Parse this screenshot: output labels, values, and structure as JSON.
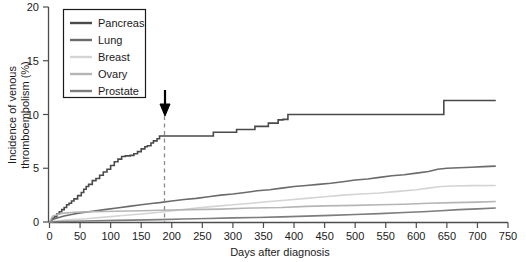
{
  "chart_data": {
    "type": "line",
    "title": "",
    "xlabel": "Days after diagnosis",
    "ylabel": "Incidence of venous thromboembolism (%)",
    "xlim": [
      0,
      750
    ],
    "ylim": [
      0,
      20
    ],
    "xticks": [
      0,
      50,
      100,
      150,
      200,
      250,
      300,
      350,
      400,
      450,
      500,
      550,
      600,
      650,
      700,
      750
    ],
    "yticks": [
      0,
      5,
      10,
      15,
      20
    ],
    "grid": false,
    "legend_position": "top-left",
    "annotations": [
      {
        "name": "six-month-marker",
        "type": "vertical-dashed-line-with-arrow",
        "x": 180,
        "label": ""
      }
    ],
    "series": [
      {
        "name": "Pancreas",
        "color": "#4a4a4a",
        "points": [
          [
            0,
            0.0
          ],
          [
            4,
            0.35
          ],
          [
            8,
            0.5
          ],
          [
            12,
            0.75
          ],
          [
            16,
            0.95
          ],
          [
            20,
            1.15
          ],
          [
            24,
            1.35
          ],
          [
            28,
            1.6
          ],
          [
            32,
            1.75
          ],
          [
            36,
            1.95
          ],
          [
            40,
            2.15
          ],
          [
            46,
            2.45
          ],
          [
            52,
            2.75
          ],
          [
            56,
            3.05
          ],
          [
            60,
            3.3
          ],
          [
            64,
            3.5
          ],
          [
            70,
            3.85
          ],
          [
            76,
            4.05
          ],
          [
            82,
            4.35
          ],
          [
            88,
            4.65
          ],
          [
            94,
            4.9
          ],
          [
            100,
            5.25
          ],
          [
            106,
            5.6
          ],
          [
            112,
            5.85
          ],
          [
            118,
            6.1
          ],
          [
            124,
            6.15
          ],
          [
            132,
            6.2
          ],
          [
            138,
            6.35
          ],
          [
            144,
            6.55
          ],
          [
            150,
            6.8
          ],
          [
            156,
            7.0
          ],
          [
            160,
            7.1
          ],
          [
            166,
            7.35
          ],
          [
            170,
            7.55
          ],
          [
            176,
            7.75
          ],
          [
            180,
            8.0
          ],
          [
            196,
            8.0
          ],
          [
            230,
            8.0
          ],
          [
            262,
            8.0
          ],
          [
            268,
            8.35
          ],
          [
            300,
            8.35
          ],
          [
            306,
            8.6
          ],
          [
            330,
            8.6
          ],
          [
            336,
            8.9
          ],
          [
            352,
            8.9
          ],
          [
            358,
            9.2
          ],
          [
            368,
            9.2
          ],
          [
            374,
            9.5
          ],
          [
            382,
            9.55
          ],
          [
            390,
            10.0
          ],
          [
            404,
            10.0
          ],
          [
            470,
            10.0
          ],
          [
            540,
            10.0
          ],
          [
            600,
            10.0
          ],
          [
            640,
            10.0
          ],
          [
            645,
            11.3
          ],
          [
            660,
            11.3
          ],
          [
            700,
            11.3
          ],
          [
            730,
            11.3
          ]
        ]
      },
      {
        "name": "Lung",
        "color": "#6b6b6b",
        "points": [
          [
            0,
            0.0
          ],
          [
            6,
            0.25
          ],
          [
            14,
            0.4
          ],
          [
            24,
            0.55
          ],
          [
            36,
            0.7
          ],
          [
            50,
            0.85
          ],
          [
            70,
            1.0
          ],
          [
            90,
            1.15
          ],
          [
            110,
            1.3
          ],
          [
            130,
            1.45
          ],
          [
            150,
            1.6
          ],
          [
            170,
            1.75
          ],
          [
            180,
            1.8
          ],
          [
            200,
            1.95
          ],
          [
            220,
            2.1
          ],
          [
            240,
            2.2
          ],
          [
            260,
            2.35
          ],
          [
            280,
            2.5
          ],
          [
            300,
            2.6
          ],
          [
            320,
            2.75
          ],
          [
            340,
            2.9
          ],
          [
            360,
            3.0
          ],
          [
            380,
            3.15
          ],
          [
            400,
            3.3
          ],
          [
            420,
            3.4
          ],
          [
            440,
            3.5
          ],
          [
            460,
            3.6
          ],
          [
            480,
            3.75
          ],
          [
            500,
            3.9
          ],
          [
            520,
            4.0
          ],
          [
            540,
            4.15
          ],
          [
            560,
            4.3
          ],
          [
            580,
            4.4
          ],
          [
            600,
            4.55
          ],
          [
            620,
            4.7
          ],
          [
            635,
            4.9
          ],
          [
            650,
            5.0
          ],
          [
            670,
            5.05
          ],
          [
            690,
            5.1
          ],
          [
            710,
            5.15
          ],
          [
            730,
            5.2
          ]
        ]
      },
      {
        "name": "Breast",
        "color": "#d4d4d4",
        "points": [
          [
            0,
            0.0
          ],
          [
            10,
            0.1
          ],
          [
            30,
            0.2
          ],
          [
            60,
            0.3
          ],
          [
            90,
            0.45
          ],
          [
            120,
            0.6
          ],
          [
            150,
            0.75
          ],
          [
            180,
            0.9
          ],
          [
            210,
            1.1
          ],
          [
            240,
            1.3
          ],
          [
            270,
            1.45
          ],
          [
            300,
            1.6
          ],
          [
            330,
            1.75
          ],
          [
            360,
            1.9
          ],
          [
            390,
            2.05
          ],
          [
            420,
            2.2
          ],
          [
            450,
            2.35
          ],
          [
            480,
            2.5
          ],
          [
            510,
            2.6
          ],
          [
            540,
            2.7
          ],
          [
            570,
            2.85
          ],
          [
            600,
            3.0
          ],
          [
            620,
            3.15
          ],
          [
            640,
            3.3
          ],
          [
            660,
            3.35
          ],
          [
            690,
            3.38
          ],
          [
            730,
            3.4
          ]
        ]
      },
      {
        "name": "Ovary",
        "color": "#b5b5b5",
        "points": [
          [
            0,
            0.0
          ],
          [
            5,
            0.55
          ],
          [
            20,
            0.8
          ],
          [
            40,
            0.9
          ],
          [
            70,
            0.95
          ],
          [
            110,
            1.0
          ],
          [
            150,
            1.05
          ],
          [
            180,
            1.1
          ],
          [
            230,
            1.15
          ],
          [
            280,
            1.2
          ],
          [
            330,
            1.3
          ],
          [
            380,
            1.35
          ],
          [
            420,
            1.45
          ],
          [
            450,
            1.5
          ],
          [
            500,
            1.55
          ],
          [
            540,
            1.6
          ],
          [
            580,
            1.65
          ],
          [
            620,
            1.75
          ],
          [
            660,
            1.8
          ],
          [
            700,
            1.85
          ],
          [
            730,
            1.9
          ]
        ]
      },
      {
        "name": "Prostate",
        "color": "#7d7d7d",
        "points": [
          [
            0,
            0.0
          ],
          [
            20,
            0.05
          ],
          [
            60,
            0.1
          ],
          [
            110,
            0.15
          ],
          [
            160,
            0.2
          ],
          [
            180,
            0.22
          ],
          [
            220,
            0.28
          ],
          [
            260,
            0.32
          ],
          [
            300,
            0.38
          ],
          [
            340,
            0.42
          ],
          [
            380,
            0.48
          ],
          [
            420,
            0.55
          ],
          [
            460,
            0.62
          ],
          [
            500,
            0.7
          ],
          [
            540,
            0.78
          ],
          [
            580,
            0.88
          ],
          [
            610,
            0.95
          ],
          [
            640,
            1.05
          ],
          [
            670,
            1.15
          ],
          [
            700,
            1.22
          ],
          [
            730,
            1.3
          ]
        ]
      }
    ]
  },
  "legend": {
    "entries": [
      {
        "label": "Pancreas",
        "color": "#4a4a4a"
      },
      {
        "label": "Lung",
        "color": "#6b6b6b"
      },
      {
        "label": "Breast",
        "color": "#d4d4d4"
      },
      {
        "label": "Ovary",
        "color": "#b5b5b5"
      },
      {
        "label": "Prostate",
        "color": "#7d7d7d"
      }
    ]
  }
}
